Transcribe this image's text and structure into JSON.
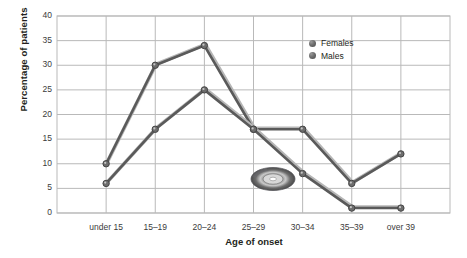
{
  "chart_data": {
    "type": "line",
    "title": "",
    "xlabel": "Age of onset",
    "ylabel": "Percentage of patients",
    "categories": [
      "under 15",
      "15–19",
      "20–24",
      "25–29",
      "30–34",
      "35–39",
      "over 39"
    ],
    "series": [
      {
        "name": "Females",
        "values": [
          10,
          30,
          34,
          17,
          17,
          6,
          12
        ],
        "color": "#5a5a5a"
      },
      {
        "name": "Males",
        "values": [
          6,
          17,
          25,
          17,
          8,
          1,
          1
        ],
        "color": "#5a5a5a"
      }
    ],
    "ylim": [
      0,
      40
    ],
    "yticks": [
      0,
      5,
      10,
      15,
      20,
      25,
      30,
      35,
      40
    ],
    "grid": true,
    "legend_position": "top-right"
  },
  "legend": {
    "items": [
      {
        "label": "Females",
        "marker": "sphere-marker-icon"
      },
      {
        "label": "Males",
        "marker": "sphere-marker-icon"
      }
    ]
  },
  "cursor": {
    "icon": "compact-disc-icon"
  },
  "colors": {
    "line": "#5a5a5a",
    "grid": "#b9b9b9",
    "text": "#231f20",
    "background": "#ffffff"
  }
}
